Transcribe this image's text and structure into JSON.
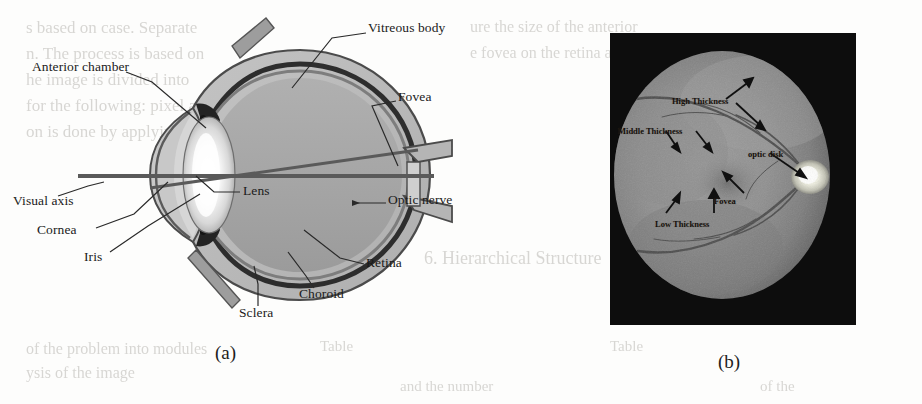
{
  "figure": {
    "panels": [
      {
        "id": "a",
        "caption": "(a)",
        "type": "eye-cross-section-diagram"
      },
      {
        "id": "b",
        "caption": "(b)",
        "type": "retinal-fundus-photograph"
      }
    ]
  },
  "panel_a": {
    "caption": "(a)",
    "labels": [
      {
        "name": "vitreous-body",
        "text": "Vitreous body",
        "x": 368,
        "y": 27
      },
      {
        "name": "anterior-chamber",
        "text": "Anterior chamber",
        "x": 32,
        "y": 66
      },
      {
        "name": "fovea",
        "text": "Fovea",
        "x": 398,
        "y": 96
      },
      {
        "name": "lens",
        "text": "Lens",
        "x": 243,
        "y": 190
      },
      {
        "name": "optic-nerve",
        "text": "Optic nerve",
        "x": 388,
        "y": 199
      },
      {
        "name": "visual-axis",
        "text": "Visual axis",
        "x": 13,
        "y": 200
      },
      {
        "name": "cornea",
        "text": "Cornea",
        "x": 37,
        "y": 229
      },
      {
        "name": "iris",
        "text": "Iris",
        "x": 84,
        "y": 256
      },
      {
        "name": "retina",
        "text": "Retina",
        "x": 366,
        "y": 262
      },
      {
        "name": "choroid",
        "text": "Choroid",
        "x": 299,
        "y": 293
      },
      {
        "name": "sclera",
        "text": "Sclera",
        "x": 239,
        "y": 312
      }
    ],
    "colors": {
      "vitreous": "#a9a9a9",
      "sclera": "#b9b9b9",
      "choroid": "#2b2b2b",
      "lens": "#f2f2f2",
      "outline": "#3a3a3a",
      "axis_line": "#6f6f6f",
      "label_text": "#1a1a1a"
    }
  },
  "panel_b": {
    "caption": "(b)",
    "labels": [
      {
        "name": "high-thickness",
        "text": "High Thickness",
        "x": 62,
        "y": 63
      },
      {
        "name": "middle-thickness",
        "text": "Middle Thickness",
        "x": 8,
        "y": 93
      },
      {
        "name": "optic-disk",
        "text": "optic disk",
        "x": 138,
        "y": 116
      },
      {
        "name": "fovea",
        "text": "Fovea",
        "x": 104,
        "y": 163
      },
      {
        "name": "low-thickness",
        "text": "Low Thickness",
        "x": 45,
        "y": 186
      }
    ],
    "colors": {
      "background": "#0d0d0d",
      "retina_mid": "#8e8e8e",
      "retina_rim": "#6d6d6d",
      "optic_disk": "#f2f2ee",
      "vessel": "#4a4a4a",
      "label_text": "#15110d"
    }
  },
  "bleed_through": [
    {
      "text": "s based on case. Separate",
      "x": 26,
      "y": 18,
      "size": 17
    },
    {
      "text": "n. The process is based on",
      "x": 26,
      "y": 44,
      "size": 17
    },
    {
      "text": "he image is divided into",
      "x": 26,
      "y": 70,
      "size": 17
    },
    {
      "text": "for the following: pixel and",
      "x": 26,
      "y": 96,
      "size": 17
    },
    {
      "text": "on is done by applying the",
      "x": 26,
      "y": 122,
      "size": 17
    },
    {
      "text": "ure the size of the anterior",
      "x": 470,
      "y": 18,
      "size": 16
    },
    {
      "text": "e fovea on the retina and",
      "x": 470,
      "y": 44,
      "size": 16
    },
    {
      "text": "6. Hierarchical Structure",
      "x": 424,
      "y": 248,
      "size": 18
    },
    {
      "text": "of the problem into modules",
      "x": 26,
      "y": 340,
      "size": 16
    },
    {
      "text": "ysis of the image",
      "x": 26,
      "y": 364,
      "size": 16
    },
    {
      "text": "Table",
      "x": 320,
      "y": 338,
      "size": 15
    },
    {
      "text": "Table",
      "x": 610,
      "y": 338,
      "size": 15
    },
    {
      "text": "and the number",
      "x": 400,
      "y": 378,
      "size": 15
    },
    {
      "text": "of the",
      "x": 760,
      "y": 378,
      "size": 15
    }
  ]
}
